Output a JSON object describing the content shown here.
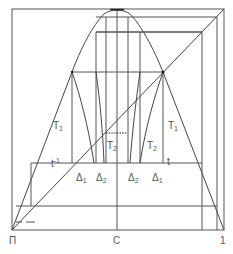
{
  "diagram": {
    "type": "phase-diagram",
    "axis_labels": {
      "left": "П",
      "center": "С",
      "right": "1"
    },
    "region_labels": {
      "T1_left": {
        "base": "T",
        "sub": "1"
      },
      "T1_right": {
        "base": "T",
        "sub": "1"
      },
      "T2_left": {
        "base": "T",
        "sub": "2"
      },
      "T2_right": {
        "base": "T",
        "sub": "2"
      },
      "t_inverse": {
        "base": "t",
        "sup": "-1"
      },
      "t": {
        "base": "t"
      },
      "delta1_left": {
        "base": "Δ",
        "sub": "1"
      },
      "delta2_left": {
        "base": "Δ",
        "sub": "2"
      },
      "delta2_right": {
        "base": "Δ",
        "sub": "2"
      },
      "delta1_right": {
        "base": "Δ",
        "sub": "1"
      }
    },
    "line_color": "#555555"
  }
}
